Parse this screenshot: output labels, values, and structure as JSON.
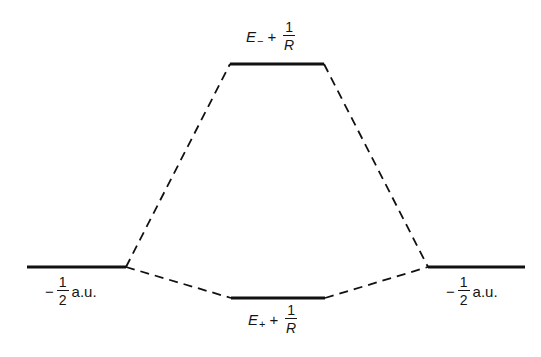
{
  "diagram": {
    "type": "energy-level-diagram",
    "levels": [
      {
        "id": "left",
        "x1": 27,
        "x2": 126,
        "y": 267
      },
      {
        "id": "antibonding",
        "x1": 230,
        "x2": 324,
        "y": 64
      },
      {
        "id": "bonding",
        "x1": 231,
        "x2": 325,
        "y": 298
      },
      {
        "id": "right",
        "x1": 428,
        "x2": 525,
        "y": 267
      }
    ],
    "connectors": [
      {
        "from": "left",
        "to": "antibonding",
        "x1": 126,
        "y1": 267,
        "x2": 230,
        "y2": 64
      },
      {
        "from": "left",
        "to": "bonding",
        "x1": 126,
        "y1": 267,
        "x2": 231,
        "y2": 298
      },
      {
        "from": "antibonding",
        "to": "right",
        "x1": 324,
        "y1": 64,
        "x2": 428,
        "y2": 267
      },
      {
        "from": "bonding",
        "to": "right",
        "x1": 325,
        "y1": 298,
        "x2": 428,
        "y2": 267
      }
    ],
    "labels": {
      "top": {
        "symbol": "E",
        "subscript": "−",
        "operator": "+",
        "frac_num": "1",
        "frac_den": "R"
      },
      "bottom": {
        "symbol": "E",
        "subscript": "+",
        "operator": "+",
        "frac_num": "1",
        "frac_den": "R"
      },
      "left": {
        "sign": "−",
        "frac_num": "1",
        "frac_den": "2",
        "unit": "a.u."
      },
      "right": {
        "sign": "−",
        "frac_num": "1",
        "frac_den": "2",
        "unit": "a.u."
      }
    },
    "colors": {
      "line": "#111111",
      "background": "#ffffff"
    }
  }
}
